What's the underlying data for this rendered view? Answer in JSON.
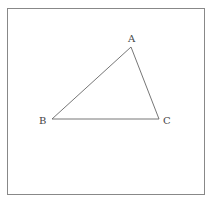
{
  "diagram": {
    "type": "triangle",
    "frame": {
      "x": 7.5,
      "y": 8.5,
      "width": 197,
      "height": 186,
      "stroke": "#888888"
    },
    "stroke_color": "#666666",
    "vertices": [
      {
        "label": "A",
        "x": 131,
        "y": 47,
        "label_x": 128,
        "label_y": 42
      },
      {
        "label": "B",
        "x": 52,
        "y": 119,
        "label_x": 39,
        "label_y": 124
      },
      {
        "label": "C",
        "x": 159,
        "y": 119,
        "label_x": 163,
        "label_y": 124
      }
    ]
  }
}
